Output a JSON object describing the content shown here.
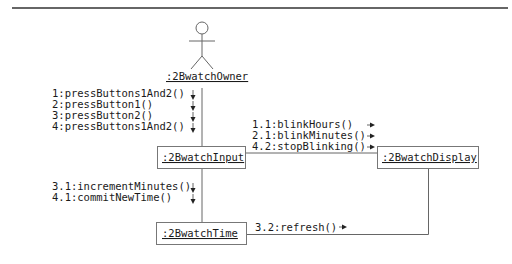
{
  "diagram": {
    "type": "UML communication diagram",
    "actor": {
      "label": ":2BwatchOwner",
      "icon": "stick-figure-icon"
    },
    "objects": [
      {
        "id": "input",
        "label": ":2BwatchInput"
      },
      {
        "id": "display",
        "label": ":2BwatchDisplay"
      },
      {
        "id": "time",
        "label": ":2BwatchTime"
      }
    ],
    "links": [
      {
        "from": ":2BwatchOwner",
        "to": ":2BwatchInput",
        "messages": [
          "1:pressButtons1And2()",
          "2:pressButton1()",
          "3:pressButton2()",
          "4:pressButtons1And2()"
        ],
        "direction": "down"
      },
      {
        "from": ":2BwatchInput",
        "to": ":2BwatchDisplay",
        "messages": [
          "1.1:blinkHours()",
          "2.1:blinkMinutes()",
          "4.2:stopBlinking()"
        ],
        "direction": "right"
      },
      {
        "from": ":2BwatchInput",
        "to": ":2BwatchTime",
        "messages": [
          "3.1:incrementMinutes()",
          "4.1:commitNewTime()"
        ],
        "direction": "down"
      },
      {
        "from": ":2BwatchTime",
        "to": ":2BwatchDisplay",
        "messages": [
          "3.2:refresh()"
        ],
        "direction": "right"
      }
    ]
  }
}
